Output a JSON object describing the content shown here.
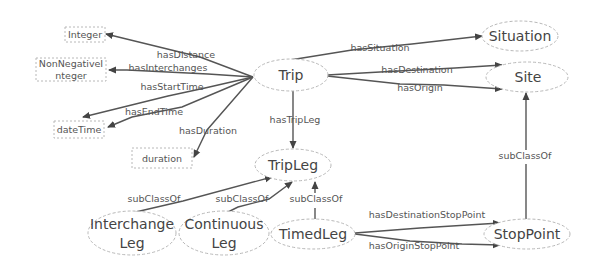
{
  "diagram": {
    "type": "ontology-graph",
    "nodes": {
      "integer": "Integer",
      "nonneg_line1": "NonNegativeI",
      "nonneg_line2": "nteger",
      "datetime": "dateTime",
      "duration": "duration",
      "trip": "Trip",
      "situation": "Situation",
      "site": "Site",
      "tripleg": "TripLeg",
      "interchange_line1": "Interchange",
      "interchange_line2": "Leg",
      "continuous_line1": "Continuous",
      "continuous_line2": "Leg",
      "timedleg": "TimedLeg",
      "stoppoint": "StopPoint"
    },
    "edges": {
      "hasDistance": "hasDistance",
      "hasInterchanges": "hasInterchanges",
      "hasStartTime": "hasStartTime",
      "hasEndTime": "hasEndTime",
      "hasDuration": "hasDuration",
      "hasSituation": "hasSituation",
      "hasDestination": "hasDestination",
      "hasOrigin": "hasOrigin",
      "hasTripLeg": "hasTripLeg",
      "subClassOf_interchange": "subClassOf",
      "subClassOf_continuous": "subClassOf",
      "subClassOf_timed": "subClassOf",
      "subClassOf_stoppoint": "subClassOf",
      "hasDestinationStopPoint": "hasDestinationStopPoint",
      "hasOriginStopPoint": "hasOriginStopPoint"
    },
    "relations": [
      {
        "from": "Trip",
        "label": "hasDistance",
        "to": "Integer"
      },
      {
        "from": "Trip",
        "label": "hasInterchanges",
        "to": "NonNegativeInteger"
      },
      {
        "from": "Trip",
        "label": "hasStartTime",
        "to": "dateTime"
      },
      {
        "from": "Trip",
        "label": "hasEndTime",
        "to": "dateTime"
      },
      {
        "from": "Trip",
        "label": "hasDuration",
        "to": "duration"
      },
      {
        "from": "Trip",
        "label": "hasSituation",
        "to": "Situation"
      },
      {
        "from": "Trip",
        "label": "hasDestination",
        "to": "Site"
      },
      {
        "from": "Trip",
        "label": "hasOrigin",
        "to": "Site"
      },
      {
        "from": "Trip",
        "label": "hasTripLeg",
        "to": "TripLeg"
      },
      {
        "from": "InterchangeLeg",
        "label": "subClassOf",
        "to": "TripLeg"
      },
      {
        "from": "ContinuousLeg",
        "label": "subClassOf",
        "to": "TripLeg"
      },
      {
        "from": "TimedLeg",
        "label": "subClassOf",
        "to": "TripLeg"
      },
      {
        "from": "StopPoint",
        "label": "subClassOf",
        "to": "Site"
      },
      {
        "from": "TimedLeg",
        "label": "hasDestinationStopPoint",
        "to": "StopPoint"
      },
      {
        "from": "TimedLeg",
        "label": "hasOriginStopPoint",
        "to": "StopPoint"
      }
    ],
    "colors": {
      "edge": "#555555",
      "node_border": "#b8b8b8",
      "text": "#444444"
    }
  }
}
